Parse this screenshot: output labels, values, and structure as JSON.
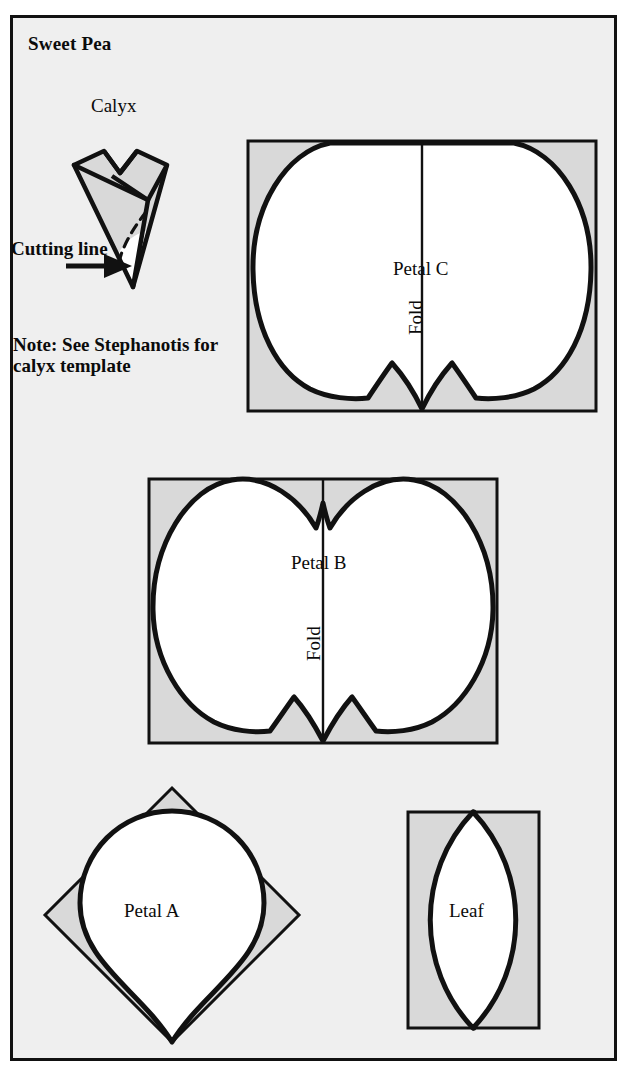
{
  "page": {
    "title": "Sweet Pea",
    "background_color": "#efefef",
    "border_color": "#111111",
    "ink_color": "#0b0b0b",
    "fill_white": "#ffffff",
    "fill_gray": "#d9d9d9"
  },
  "calyx": {
    "label": "Calyx",
    "cutting_line_label": "Cutting line",
    "note": "Note: See Stephanotis for calyx template"
  },
  "templates": [
    {
      "id": "petal-c",
      "label": "Petal C",
      "fold_label": "Fold",
      "shape": "rectangle-with-double-lobed-petal",
      "notch_top": false,
      "notch_bottom": true
    },
    {
      "id": "petal-b",
      "label": "Petal B",
      "fold_label": "Fold",
      "shape": "rectangle-with-double-lobed-petal",
      "notch_top": true,
      "notch_bottom": true
    },
    {
      "id": "petal-a",
      "label": "Petal A",
      "fold_label": "",
      "shape": "diamond-with-inscribed-teardrop",
      "notch_top": false,
      "notch_bottom": false
    },
    {
      "id": "leaf",
      "label": "Leaf",
      "fold_label": "",
      "shape": "rectangle-with-vesica-lens",
      "notch_top": false,
      "notch_bottom": false
    }
  ]
}
